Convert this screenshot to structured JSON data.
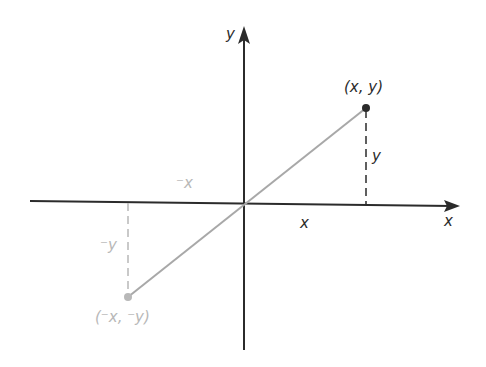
{
  "diagram": {
    "title": "",
    "axes": {
      "x_label": "x",
      "y_label": "y"
    },
    "points": {
      "positive": {
        "label": "(x, y)"
      },
      "negative": {
        "label": "(⁻x, ⁻y)"
      }
    },
    "segment_labels": {
      "pos_x": "x",
      "pos_y": "y",
      "neg_x": "⁻x",
      "neg_y": "⁻y"
    },
    "colors": {
      "axis": "#2b2b2b",
      "positive": "#2b2b2b",
      "negative": "#b8b8b8",
      "segment": "#a8a8a8"
    }
  }
}
